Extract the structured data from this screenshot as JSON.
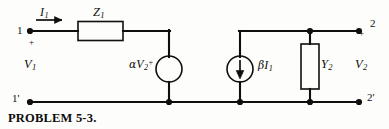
{
  "figure": {
    "caption": "PROBLEM 5-3.",
    "type": "two-port-circuit-schematic"
  },
  "terminals": {
    "input_top": "1",
    "input_bottom": "1'",
    "output_top": "2",
    "output_bottom": "2'",
    "input_polarity": "+",
    "output_polarity": "+"
  },
  "labels": {
    "input_current": {
      "symbol": "I",
      "subscript": "1"
    },
    "series_impedance": {
      "symbol": "Z",
      "subscript": "1"
    },
    "input_voltage": {
      "symbol": "V",
      "subscript": "1"
    },
    "dependent_voltage_source": {
      "coefficient": "α",
      "symbol": "V",
      "subscript": "2",
      "superscript": "+"
    },
    "dependent_current_source": {
      "coefficient": "β",
      "symbol": "I",
      "subscript": "1"
    },
    "shunt_admittance": {
      "symbol": "Y",
      "subscript": "2"
    },
    "output_voltage": {
      "symbol": "V",
      "subscript": "2"
    }
  },
  "elements": [
    {
      "name": "series-impedance-z1",
      "kind": "rectangle-box",
      "label": "Z1"
    },
    {
      "name": "dependent-voltage-source-alpha-v2",
      "kind": "circle-source",
      "label": "alpha V2+"
    },
    {
      "name": "dependent-current-source-beta-i1",
      "kind": "circle-source-with-down-arrow",
      "label": "beta I1"
    },
    {
      "name": "shunt-admittance-y2",
      "kind": "rectangle-box",
      "label": "Y2"
    }
  ],
  "colors": {
    "ink": "#100f0d",
    "paper": "#fdfdfb"
  }
}
